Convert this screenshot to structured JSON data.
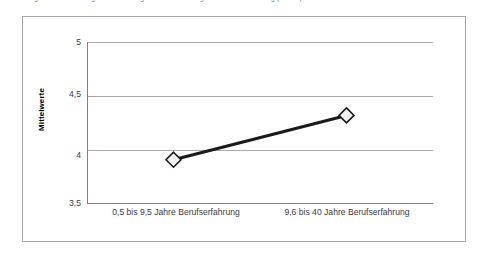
{
  "caption": {
    "text": "Abbildung 12: Einschätzung der Bedeutung von Weiterbildung nach Berufserfahrung (n = 84)",
    "clipped": true
  },
  "chart_data": {
    "type": "line",
    "title": "",
    "xlabel": "",
    "ylabel": "Mittelwerte",
    "categories": [
      "0,5 bis 9,5 Jahre Berufserfahrung",
      "9,6 bis 40 Jahre Berufserfahrung"
    ],
    "values": [
      3.91,
      4.32
    ],
    "ylim": [
      3.5,
      5.0
    ],
    "yticks": [
      "3,5",
      "4",
      "4,5",
      "5"
    ],
    "ytick_values": [
      3.5,
      4.0,
      4.5,
      5.0
    ],
    "gridlines": [
      4.0,
      4.5,
      5.0
    ],
    "grid": true,
    "legend": false,
    "series": [
      {
        "name": "Mittelwerte",
        "values": [
          3.91,
          4.32
        ],
        "marker": "diamond",
        "marker_fill": "#f2f2f2",
        "marker_stroke": "#1a1a1a",
        "line_color": "#1a1a1a",
        "line_width": 3
      }
    ],
    "colors": {
      "line": "#1a1a1a",
      "marker_fill": "#f2f2f2",
      "marker_stroke": "#1a1a1a",
      "gridline": "#a9a9a9",
      "axis": "#808080",
      "frame": "#a6a6a6",
      "text": "#3a3a3a",
      "background": "#ffffff"
    }
  }
}
